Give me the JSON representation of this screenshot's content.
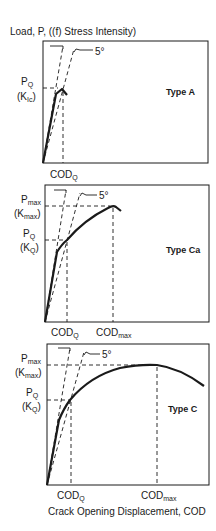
{
  "figure": {
    "y_axis_title": "Load, P, ((f) Stress Intensity)",
    "x_axis_title": "Crack Opening Displacement, COD",
    "angle_label": "5°"
  },
  "panels": [
    {
      "type_label": "Type A",
      "y_labels": [
        {
          "main": "P",
          "sub": "Q"
        },
        {
          "main": "(K",
          "sub": "Ic",
          "close": ")"
        }
      ],
      "x_labels": [
        {
          "main": "COD",
          "sub": "Q"
        }
      ]
    },
    {
      "type_label": "Type Ca",
      "y_labels": [
        {
          "main": "P",
          "sub": "max"
        },
        {
          "main": "(K",
          "sub": "max",
          "close": ")"
        },
        {
          "main": "P",
          "sub": "Q"
        },
        {
          "main": "(K",
          "sub": "Q",
          "close": ")"
        }
      ],
      "x_labels": [
        {
          "main": "COD",
          "sub": "Q"
        },
        {
          "main": "COD",
          "sub": "max"
        }
      ]
    },
    {
      "type_label": "Type C",
      "y_labels": [
        {
          "main": "P",
          "sub": "max"
        },
        {
          "main": "(K",
          "sub": "max",
          "close": ")"
        },
        {
          "main": "P",
          "sub": "Q"
        },
        {
          "main": "(K",
          "sub": "Q",
          "close": ")"
        }
      ],
      "x_labels": [
        {
          "main": "COD",
          "sub": "Q"
        },
        {
          "main": "COD",
          "sub": "max"
        }
      ]
    }
  ],
  "colors": {
    "ink": "#1a1a1a",
    "background": "#ffffff"
  }
}
